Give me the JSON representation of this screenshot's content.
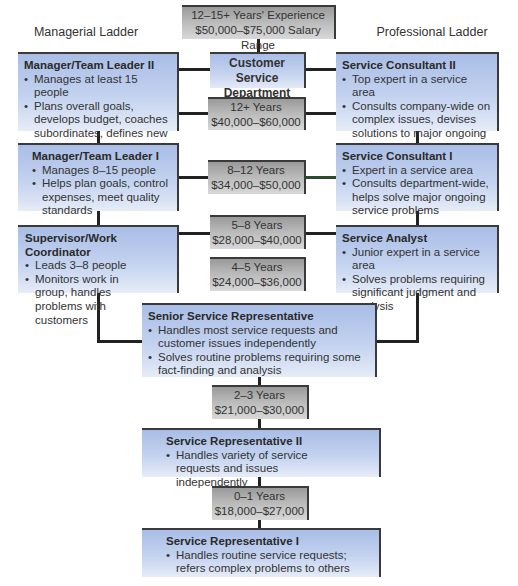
{
  "diagram": {
    "ladders": {
      "managerial_label": "Managerial Ladder",
      "professional_label": "Professional Ladder"
    },
    "top_box": {
      "line1": "12–15+ Years' Experience",
      "line2": "$50,000–$75,000 Salary Range"
    },
    "department_head": {
      "line1": "Customer Service",
      "line2": "Department Head"
    },
    "salary_bands": [
      {
        "years": "12+ Years",
        "range": "$40,000–$60,000"
      },
      {
        "years": "8–12 Years",
        "range": "$34,000–$50,000"
      },
      {
        "years": "5–8 Years",
        "range": "$28,000–$40,000"
      },
      {
        "years": "4–5 Years",
        "range": "$24,000–$36,000"
      },
      {
        "years": "2–3 Years",
        "range": "$21,000–$30,000"
      },
      {
        "years": "0–1 Years",
        "range": "$18,000–$27,000"
      }
    ],
    "managerial": [
      {
        "title": "Manager/Team Leader II",
        "bullets": [
          "Manages at least 15 people",
          "Plans overall goals, develops budget, coaches subordinates, defines new work methods"
        ]
      },
      {
        "title": "Manager/Team Leader I",
        "bullets": [
          "Manages 8–15 people",
          "Helps plan goals, control expenses, meet quality standards"
        ]
      },
      {
        "title": "Supervisor/Work Coordinator",
        "bullets": [
          "Leads 3–8 people",
          "Monitors work in group, handles problems with customers"
        ]
      }
    ],
    "professional": [
      {
        "title": "Service Consultant II",
        "bullets": [
          "Top expert in a service area",
          "Consults company-wide on complex issues, devises solutions to major ongoing and new service problems"
        ]
      },
      {
        "title": "Service Consultant I",
        "bullets": [
          "Expert in a service area",
          "Consults department-wide, helps solve major ongoing service problems"
        ]
      },
      {
        "title": "Service Analyst",
        "bullets": [
          "Junior expert in a service area",
          "Solves problems requiring significant judgment and analysis"
        ]
      }
    ],
    "entry": [
      {
        "title": "Senior Service Representative",
        "bullets": [
          "Handles most service requests and customer issues independently",
          "Solves routine problems requiring some fact-finding  and analysis"
        ]
      },
      {
        "title": "Service Representative II",
        "bullets": [
          "Handles variety of service requests and issues independently"
        ]
      },
      {
        "title": "Service Representative I",
        "bullets": [
          "Handles routine service requests; refers complex problems to others"
        ]
      }
    ],
    "colors": {
      "role_box_top": "#a9bde6",
      "role_box_bottom": "#e6ecf8",
      "salary_box_top": "#9a9a9a",
      "salary_box_bottom": "#d8d8d8",
      "connector": "#222222"
    }
  }
}
